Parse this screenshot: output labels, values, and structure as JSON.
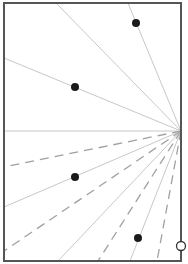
{
  "diagram": {
    "width": 188,
    "height": 264,
    "frame": {
      "x1": 4,
      "y1": 3,
      "x2": 181,
      "y2": 261,
      "stroke": "#555555",
      "stroke_width": 2
    },
    "focal_point": {
      "x": 181,
      "y": 131
    },
    "rays": [
      {
        "to": [
          56,
          3
        ],
        "style": "solid"
      },
      {
        "to": [
          128,
          3
        ],
        "style": "solid"
      },
      {
        "to": [
          4,
          58
        ],
        "style": "solid"
      },
      {
        "to": [
          4,
          131
        ],
        "style": "solid"
      },
      {
        "to": [
          4,
          167
        ],
        "style": "dashed"
      },
      {
        "to": [
          4,
          207
        ],
        "style": "solid"
      },
      {
        "to": [
          4,
          251
        ],
        "style": "dashed"
      },
      {
        "to": [
          58,
          261
        ],
        "style": "solid"
      },
      {
        "to": [
          98,
          261
        ],
        "style": "dashed"
      },
      {
        "to": [
          130,
          261
        ],
        "style": "solid"
      },
      {
        "to": [
          157,
          261
        ],
        "style": "dashed"
      }
    ],
    "solid_color": "#c8c8c8",
    "dashed_color": "#a0a0a0",
    "dots": [
      {
        "x": 136,
        "y": 23
      },
      {
        "x": 75,
        "y": 87
      },
      {
        "x": 75,
        "y": 177
      },
      {
        "x": 138,
        "y": 238
      }
    ],
    "dot_color": "#1a1a1a",
    "open_circle": {
      "x": 181,
      "y": 246,
      "r": 4.5
    }
  }
}
